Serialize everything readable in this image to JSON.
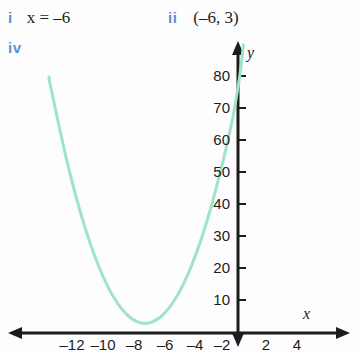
{
  "answers": [
    {
      "key": "i",
      "text": "x = –6"
    },
    {
      "key": "ii",
      "text": "(–6, 3)"
    },
    {
      "key": "iv",
      "text": ""
    }
  ],
  "colors": {
    "roman_numeral": "#5b8fd6",
    "curve": "#9fe3c8",
    "axis": "#1c1c1c",
    "text": "#1c1c1c",
    "background": "#fdfdfd"
  },
  "axis_labels": {
    "x": "x",
    "y": "y"
  },
  "chart_data": {
    "type": "line",
    "title": "",
    "xlabel": "x",
    "ylabel": "y",
    "grid": false,
    "legend": null,
    "xlim": [
      -14.7,
      7.7
    ],
    "ylim": [
      -0.6,
      91
    ],
    "x_ticks": [
      -12,
      -10,
      -8,
      -6,
      -4,
      -2,
      2,
      4
    ],
    "x_tick_labels": [
      "–12",
      "–10",
      "–8",
      "–6",
      "–4",
      "–2",
      "2",
      "4"
    ],
    "y_ticks": [
      10,
      20,
      30,
      40,
      50,
      60,
      70,
      80
    ],
    "y_tick_labels": [
      "10",
      "20",
      "30",
      "40",
      "50",
      "60",
      "70",
      "80"
    ],
    "series": [
      {
        "name": "parabola",
        "color": "#9fe3c8",
        "equation": "y = 2(x + 6)^2 + 3",
        "vertex": [
          -6,
          3
        ],
        "points": [
          [
            -12.2,
            80.0
          ],
          [
            -12.0,
            75.0
          ],
          [
            -11.0,
            53.0
          ],
          [
            -10.0,
            35.0
          ],
          [
            -9.0,
            21.0
          ],
          [
            -8.0,
            11.0
          ],
          [
            -7.0,
            5.0
          ],
          [
            -6.0,
            3.0
          ],
          [
            -5.0,
            5.0
          ],
          [
            -4.0,
            11.0
          ],
          [
            -3.0,
            21.0
          ],
          [
            -2.0,
            35.0
          ],
          [
            -1.0,
            53.0
          ],
          [
            -0.35,
            67.0
          ],
          [
            0.1,
            80.0
          ],
          [
            0.35,
            90.0
          ]
        ]
      }
    ]
  }
}
